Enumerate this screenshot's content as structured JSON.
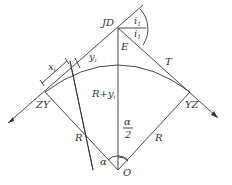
{
  "diagram": {
    "title": "",
    "labels": {
      "jd": "JD",
      "e": "E",
      "i1": "i",
      "i1_sub": "1",
      "i2": "i",
      "i2_sub": "1",
      "t": "T",
      "zy": "ZY",
      "yz": "YZ",
      "r_left": "R",
      "r_right": "R",
      "r_plus_yi": "R+y",
      "r_plus_yi_sub": "i",
      "x_i": "x",
      "x_i_sub": "i",
      "y_i": "y",
      "y_i_sub": "i",
      "alpha": "α",
      "alpha_half_num": "α",
      "alpha_half_den": "2",
      "o": "O"
    }
  }
}
